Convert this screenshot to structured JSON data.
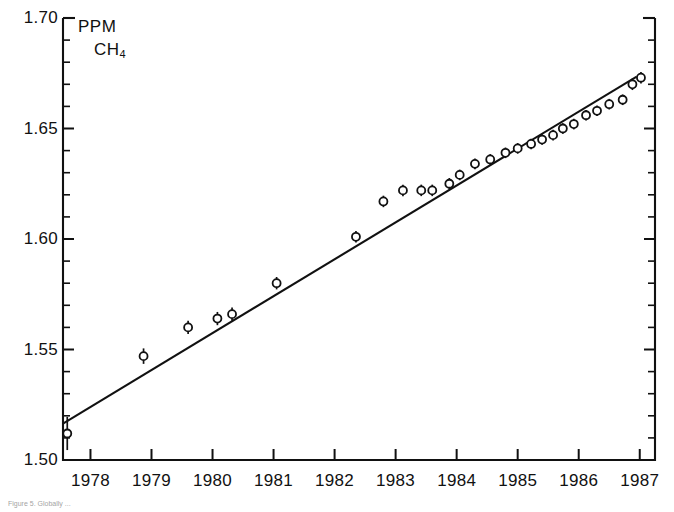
{
  "figure": {
    "unit_line1": "PPM",
    "unit_line2_base": "CH",
    "unit_line2_sub": "4",
    "caption": "Figure 5.  Globally ...",
    "line_color": "#111111",
    "marker_color": "#111111",
    "background": "#ffffff"
  },
  "axes": {
    "y_ticks_major": [
      "1.70",
      "1.65",
      "1.60",
      "1.55",
      "1.50"
    ],
    "y_major_values": [
      1.7,
      1.65,
      1.6,
      1.55,
      1.5
    ],
    "y_minor_step": 0.01,
    "x_ticks": [
      "1978",
      "1979",
      "1980",
      "1981",
      "1982",
      "1983",
      "1984",
      "1985",
      "1986",
      "1987"
    ],
    "x_tick_values": [
      1978,
      1979,
      1980,
      1981,
      1982,
      1983,
      1984,
      1985,
      1986,
      1987
    ]
  },
  "chart_data": {
    "type": "scatter",
    "title": "",
    "subtitle": "",
    "xlabel": "",
    "ylabel": "PPM CH4",
    "xlim": [
      1977.55,
      1987.25
    ],
    "ylim": [
      1.5,
      1.7
    ],
    "grid": false,
    "legend": null,
    "marker": "open-circle",
    "errorbars": true,
    "series": [
      {
        "name": "CH4 global mean",
        "x": [
          1977.62,
          1978.87,
          1979.6,
          1980.08,
          1980.32,
          1981.05,
          1982.35,
          1982.8,
          1983.12,
          1983.42,
          1983.6,
          1983.88,
          1984.05,
          1984.3,
          1984.55,
          1984.8,
          1985.0,
          1985.22,
          1985.4,
          1985.58,
          1985.74,
          1985.92,
          1986.12,
          1986.3,
          1986.5,
          1986.72,
          1986.88,
          1987.02
        ],
        "y": [
          1.512,
          1.547,
          1.56,
          1.564,
          1.566,
          1.58,
          1.601,
          1.617,
          1.622,
          1.622,
          1.622,
          1.625,
          1.629,
          1.634,
          1.636,
          1.639,
          1.641,
          1.643,
          1.645,
          1.647,
          1.65,
          1.652,
          1.656,
          1.658,
          1.661,
          1.663,
          1.67,
          1.673
        ],
        "yerr": [
          0.0075,
          0.0035,
          0.003,
          0.003,
          0.003,
          0.0028,
          0.0026,
          0.0026,
          0.0026,
          0.0026,
          0.0026,
          0.0026,
          0.0024,
          0.0024,
          0.0024,
          0.0024,
          0.0024,
          0.0024,
          0.0024,
          0.0024,
          0.0024,
          0.0024,
          0.0024,
          0.0024,
          0.0024,
          0.0024,
          0.0026,
          0.0026
        ]
      }
    ],
    "fit_line": {
      "name": "linear trend",
      "x": [
        1977.55,
        1986.95
      ],
      "y": [
        1.5165,
        1.6735
      ]
    }
  }
}
